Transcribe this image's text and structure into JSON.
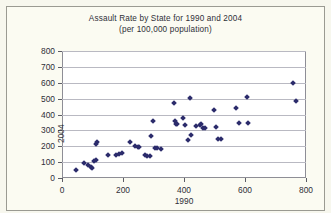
{
  "chart_data": {
    "type": "scatter",
    "title": "Assault Rate by State for 1990 and 2004",
    "subtitle": "(per 100,000 population)",
    "xlabel": "1990",
    "ylabel": "2004",
    "xlim": [
      0,
      800
    ],
    "ylim": [
      0,
      800
    ],
    "xticks": [
      0,
      200,
      400,
      600,
      800
    ],
    "yticks": [
      0,
      100,
      200,
      300,
      400,
      500,
      600,
      700,
      800
    ],
    "grid": true,
    "legend": "none",
    "marker": "diamond",
    "marker_color": "#2b2b6b",
    "plot_background": "#ffffff",
    "figure_background": "#fbfbf2",
    "points": [
      [
        46,
        48
      ],
      [
        71,
        95
      ],
      [
        86,
        84
      ],
      [
        96,
        72
      ],
      [
        99,
        60
      ],
      [
        104,
        108
      ],
      [
        110,
        114
      ],
      [
        112,
        213
      ],
      [
        115,
        228
      ],
      [
        152,
        147
      ],
      [
        176,
        146
      ],
      [
        186,
        152
      ],
      [
        196,
        158
      ],
      [
        222,
        228
      ],
      [
        240,
        204
      ],
      [
        248,
        196
      ],
      [
        252,
        198
      ],
      [
        272,
        143
      ],
      [
        280,
        141
      ],
      [
        287,
        137
      ],
      [
        292,
        263
      ],
      [
        297,
        356
      ],
      [
        304,
        190
      ],
      [
        312,
        186
      ],
      [
        325,
        184
      ],
      [
        368,
        474
      ],
      [
        371,
        359
      ],
      [
        373,
        339
      ],
      [
        376,
        343
      ],
      [
        398,
        378
      ],
      [
        404,
        332
      ],
      [
        412,
        241
      ],
      [
        420,
        501
      ],
      [
        424,
        268
      ],
      [
        440,
        329
      ],
      [
        452,
        336
      ],
      [
        456,
        341
      ],
      [
        462,
        318
      ],
      [
        468,
        312
      ],
      [
        497,
        431
      ],
      [
        506,
        323
      ],
      [
        513,
        247
      ],
      [
        521,
        244
      ],
      [
        571,
        441
      ],
      [
        580,
        345
      ],
      [
        608,
        510
      ],
      [
        611,
        344
      ],
      [
        757,
        601
      ],
      [
        766,
        488
      ]
    ]
  }
}
